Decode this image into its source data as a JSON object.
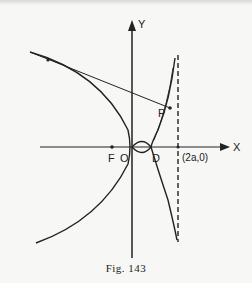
{
  "figure": {
    "caption": "Fig. 143",
    "labels": {
      "y_axis": "Y",
      "x_axis": "X",
      "focus": "F",
      "origin": "O",
      "point_d": "D",
      "point_p": "P",
      "asymptote_point": "(2a,0)"
    },
    "elements": [
      "parabola opening left with vertex at O",
      "tangent line from upper-left point on parabola through P",
      "curve (cissoid) through O and D approaching dashed asymptote x = 2a",
      "small loop between O and D",
      "dashed vertical asymptote at (2a,0)"
    ]
  }
}
